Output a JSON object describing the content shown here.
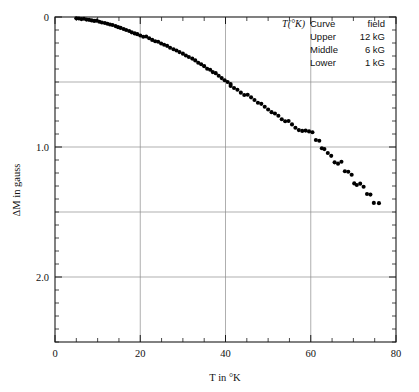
{
  "chart_data": {
    "type": "scatter",
    "title": "",
    "xlabel": "T in °K",
    "ylabel": "ΔM in gauss",
    "xlim": [
      0,
      80
    ],
    "ylim": [
      0,
      2.5
    ],
    "y_inverted": true,
    "grid": true,
    "grid_x_values": [
      20,
      40,
      60
    ],
    "grid_y_values": [
      0.5,
      1.0,
      1.5,
      2.0
    ],
    "x_major_ticks": [
      0,
      20,
      40,
      60,
      80
    ],
    "x_major_tick_labels": [
      "0",
      "20",
      "40",
      "60",
      "80"
    ],
    "x_minor_tick_step": 5,
    "y_major_ticks": [
      0,
      1.0,
      2.0
    ],
    "y_major_tick_labels": [
      "0",
      "1.0",
      "2.0"
    ],
    "y_minor_tick_step": 0.1,
    "marker": "filled-circle",
    "marker_color": "#000000",
    "marker_size_px": 3.0,
    "series": [
      {
        "name": "ΔM vs T",
        "points": [
          [
            5.0,
            0.01
          ],
          [
            5.6,
            0.012
          ],
          [
            6.2,
            0.016
          ],
          [
            6.8,
            0.014
          ],
          [
            7.4,
            0.02
          ],
          [
            8.0,
            0.022
          ],
          [
            8.6,
            0.026
          ],
          [
            9.2,
            0.03
          ],
          [
            9.8,
            0.028
          ],
          [
            10.4,
            0.036
          ],
          [
            11.0,
            0.042
          ],
          [
            11.7,
            0.046
          ],
          [
            12.3,
            0.052
          ],
          [
            12.9,
            0.058
          ],
          [
            13.5,
            0.062
          ],
          [
            14.2,
            0.07
          ],
          [
            14.8,
            0.078
          ],
          [
            15.4,
            0.084
          ],
          [
            16.1,
            0.092
          ],
          [
            16.7,
            0.1
          ],
          [
            17.4,
            0.108
          ],
          [
            18.0,
            0.118
          ],
          [
            18.7,
            0.126
          ],
          [
            19.3,
            0.132
          ],
          [
            20.0,
            0.142
          ],
          [
            20.7,
            0.152
          ],
          [
            21.4,
            0.15
          ],
          [
            22.1,
            0.164
          ],
          [
            22.8,
            0.176
          ],
          [
            23.5,
            0.186
          ],
          [
            24.2,
            0.19
          ],
          [
            24.9,
            0.204
          ],
          [
            25.6,
            0.214
          ],
          [
            26.3,
            0.222
          ],
          [
            27.0,
            0.236
          ],
          [
            27.8,
            0.248
          ],
          [
            28.5,
            0.258
          ],
          [
            29.2,
            0.27
          ],
          [
            30.0,
            0.282
          ],
          [
            30.7,
            0.296
          ],
          [
            31.4,
            0.308
          ],
          [
            32.2,
            0.32
          ],
          [
            32.9,
            0.334
          ],
          [
            33.6,
            0.352
          ],
          [
            34.3,
            0.364
          ],
          [
            35.0,
            0.378
          ],
          [
            35.7,
            0.398
          ],
          [
            36.4,
            0.406
          ],
          [
            37.0,
            0.424
          ],
          [
            37.7,
            0.432
          ],
          [
            38.4,
            0.452
          ],
          [
            39.1,
            0.47
          ],
          [
            39.8,
            0.486
          ],
          [
            40.5,
            0.5
          ],
          [
            41.2,
            0.516
          ],
          [
            41.2,
            0.53
          ],
          [
            42.0,
            0.546
          ],
          [
            42.8,
            0.56
          ],
          [
            43.6,
            0.582
          ],
          [
            44.4,
            0.6
          ],
          [
            45.2,
            0.598
          ],
          [
            46.0,
            0.618
          ],
          [
            46.8,
            0.638
          ],
          [
            47.6,
            0.66
          ],
          [
            48.4,
            0.668
          ],
          [
            49.2,
            0.69
          ],
          [
            50.0,
            0.712
          ],
          [
            50.8,
            0.732
          ],
          [
            51.6,
            0.742
          ],
          [
            52.4,
            0.76
          ],
          [
            53.2,
            0.786
          ],
          [
            54.0,
            0.802
          ],
          [
            54.8,
            0.8
          ],
          [
            55.6,
            0.826
          ],
          [
            56.4,
            0.852
          ],
          [
            57.2,
            0.87
          ],
          [
            58.0,
            0.876
          ],
          [
            58.8,
            0.874
          ],
          [
            59.6,
            0.88
          ],
          [
            60.4,
            0.886
          ],
          [
            61.2,
            0.946
          ],
          [
            62.0,
            0.952
          ],
          [
            62.6,
            1.01
          ],
          [
            63.2,
            1.016
          ],
          [
            64.0,
            1.046
          ],
          [
            64.8,
            1.068
          ],
          [
            65.6,
            1.118
          ],
          [
            66.4,
            1.128
          ],
          [
            67.2,
            1.114
          ],
          [
            68.0,
            1.186
          ],
          [
            68.8,
            1.19
          ],
          [
            69.6,
            1.214
          ],
          [
            70.2,
            1.28
          ],
          [
            70.8,
            1.292
          ],
          [
            71.6,
            1.282
          ],
          [
            72.4,
            1.306
          ],
          [
            73.2,
            1.362
          ],
          [
            74.0,
            1.366
          ],
          [
            74.8,
            1.43
          ],
          [
            76.0,
            1.432
          ]
        ]
      }
    ],
    "note": "Y axis increases downward (0 at top, 2.5 at bottom). Points drift from near 0 at T=5 to about 2.4 at T=76."
  },
  "legend": {
    "header_symbol": "T(°K)",
    "header_col1": "Curve",
    "header_col2": "field",
    "rows": [
      {
        "curve": "Upper",
        "field": "12 kG"
      },
      {
        "curve": "Middle",
        "field": "6 kG"
      },
      {
        "curve": "Lower",
        "field": "1 kG"
      }
    ]
  }
}
